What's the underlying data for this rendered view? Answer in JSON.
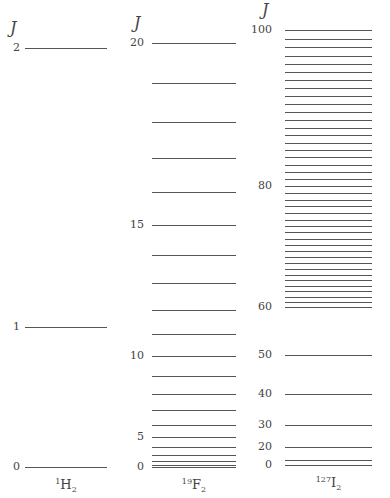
{
  "axis_symbol": "J",
  "panels": [
    {
      "id": "h2",
      "molecule": {
        "mass": "1",
        "symbol": "H",
        "sub": "2"
      },
      "jmax": 2,
      "x0": 25,
      "x1": 107,
      "y_zero": 467,
      "y_top": 48,
      "levels": [
        0,
        1,
        2
      ],
      "labels": [
        0,
        1,
        2
      ],
      "label_x": 0
    },
    {
      "id": "f2",
      "molecule": {
        "mass": "19",
        "symbol": "F",
        "sub": "2"
      },
      "jmax": 20,
      "x0": 152,
      "x1": 236,
      "y_zero": 467,
      "y_top": 43,
      "levels": [
        0,
        1,
        2,
        3,
        4,
        5,
        6,
        7,
        8,
        9,
        10,
        11,
        12,
        13,
        14,
        15,
        16,
        17,
        18,
        19,
        20
      ],
      "labels": [
        0,
        5,
        10,
        15,
        20
      ],
      "label_x": 124
    },
    {
      "id": "i2",
      "molecule": {
        "mass": "127",
        "symbol": "I",
        "sub": "2"
      },
      "jmax": 100,
      "x0": 285,
      "x1": 372,
      "y_zero": 465,
      "y_top": 30,
      "levels": [
        0,
        10,
        20,
        30,
        40,
        50,
        60,
        61,
        62,
        63,
        64,
        65,
        66,
        67,
        68,
        69,
        70,
        71,
        72,
        73,
        74,
        75,
        76,
        77,
        78,
        79,
        80,
        81,
        82,
        83,
        84,
        85,
        86,
        87,
        88,
        89,
        90,
        91,
        92,
        93,
        94,
        95,
        96,
        97,
        98,
        99,
        100
      ],
      "labels": [
        0,
        20,
        30,
        40,
        50,
        60,
        80,
        100
      ],
      "label_x": 252
    }
  ]
}
